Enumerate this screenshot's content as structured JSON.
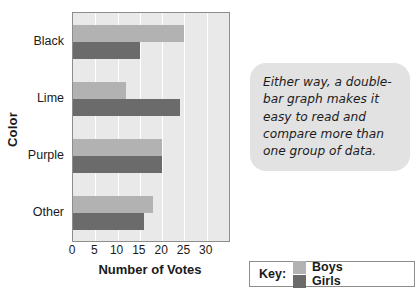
{
  "chart_data": {
    "type": "bar",
    "orientation": "horizontal",
    "title": "",
    "xlabel": "Number of Votes",
    "ylabel": "Color",
    "categories": [
      "Black",
      "Lime",
      "Purple",
      "Other"
    ],
    "series": [
      {
        "name": "Boys",
        "color": "#b2b2b2",
        "values": [
          25,
          12,
          20,
          18
        ]
      },
      {
        "name": "Girls",
        "color": "#6b6b6b",
        "values": [
          15,
          24,
          20,
          16
        ]
      }
    ],
    "xticks": [
      0,
      5,
      10,
      15,
      20,
      25,
      30
    ],
    "xlim": [
      0,
      35
    ],
    "grid": true,
    "legend_position": "bottom-right",
    "legend_title": "Key:"
  },
  "callout": {
    "text": "Either way, a double-bar graph makes it easy to read and compare more than one group of data."
  }
}
